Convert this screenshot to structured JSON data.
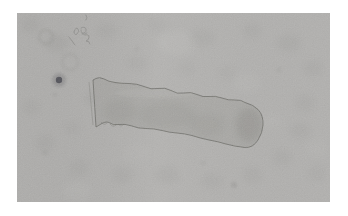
{
  "image": {
    "kind": "brightfield-micrograph",
    "description": "Light-microscope photograph of an elongated, segmented rectangular specimen with scalloped edges lying diagonally on a mottled light-gray background, framed by a white margin",
    "frame": {
      "width": 348,
      "height": 216,
      "margin_color": "#ffffff"
    },
    "photo": {
      "x": 17,
      "y": 13,
      "width": 313,
      "height": 189,
      "base_color": "#b4b3b1",
      "grain_opacity": 0.3,
      "vignette_left": "rgba(118,118,116,0.10)",
      "vignette_right": "rgba(128,128,126,0.05)"
    },
    "specimen": {
      "outline_color": "#6c6c66",
      "outline_width": 0.9,
      "outline_opacity": 0.85,
      "fill_color": "#a8a7a4",
      "fill_opacity": 0.75,
      "path": "M76,67 L79,114 C83,112 88,107 93,110 Q96,112.5 101,111.5 Q108,110.5 115,113 Q121,115.5 129,115.5 Q137,115.5 145,117.5 Q152,119.5 160,120 Q167,120.5 175,122.5 Q184,125.5 192,127 Q201,128.5 209,131 Q218,133.5 228,134.5 Q236,135 241,127 Q245.5,120 246,112 Q246.5,102 241,96.5 Q236,91.5 228,89.5 Q224,86.5 218,87 Q211,87.5 205,85 Q198,82.5 192,83.5 Q186,84.5 180,81.5 Q174,78.5 167,80 Q160,81.5 154,77.5 Q148,74 141,75.5 Q134,77 127,73.5 Q120,70.5 112,70.5 Q104,70.5 98,69.5 Q91,68.5 87,66 Q82,63.5 79,65.5 Z",
      "inner_shadow_color": "#84837f",
      "inner_shadows": [
        [
          232,
          112,
          13,
          17,
          0.3
        ],
        [
          150,
          102,
          28,
          13,
          0.14
        ],
        [
          103,
          98,
          16,
          11,
          0.14
        ],
        [
          190,
          112,
          18,
          11,
          0.12
        ]
      ],
      "inner_highlight": [
        140,
        80,
        42,
        5,
        0.16
      ],
      "double_edge": {
        "path": "M72,69 L76,112",
        "color": "#83837e",
        "opacity": 0.5
      },
      "scallop_ticks": {
        "color": "#76766f",
        "opacity": 0.45,
        "paths": [
          "M84,109 q3,4 6,1",
          "M93,111 q3,4 6,1",
          "M101,111 q3,4 6,0"
        ]
      }
    },
    "marks": {
      "squiggles": {
        "color": "#7d7d7a",
        "width": 0.9,
        "opacity": 0.55,
        "paths": [
          "M57,19 q2,-6 4,-3 q2,2 -1,5 q-2,2 -3,-2",
          "M64,15 q4,-2 5,1 q1,3 -2,4 q-3,1 -3,-3",
          "M65,21 q3,1 5,-1",
          "M68,22 q4,-1 4,2 q0,3 -3,4 q4,0 4,3",
          "M52,24 l6,8",
          "M69,2 q2,3 0,5"
        ]
      },
      "rings": {
        "color": "#8f8f8b",
        "items": [
          [
            29,
            24,
            7,
            0.3
          ],
          [
            53,
            49,
            8,
            0.22
          ]
        ]
      },
      "dark_blob": {
        "cx": 42,
        "cy": 67,
        "r": 3.2,
        "color": "#4f4f56",
        "halo_r": 7,
        "halo_opacity": 0.35,
        "halo_color": "#6e6e72"
      },
      "spots": {
        "color": "#80807c",
        "items": [
          [
            217,
            172,
            3,
            0.28
          ],
          [
            262,
            57,
            2.5,
            0.15
          ],
          [
            38,
            82,
            2,
            0.2
          ],
          [
            120,
            36,
            2.2,
            0.15
          ],
          [
            186,
            150,
            2.5,
            0.14
          ],
          [
            28,
            140,
            2.4,
            0.16
          ]
        ]
      }
    },
    "smudges": {
      "color": "#8e8e8b",
      "items": [
        [
          13,
          12,
          10,
          8,
          0.14
        ],
        [
          40,
          30,
          12,
          9,
          0.16
        ],
        [
          90,
          18,
          11,
          8,
          0.12
        ],
        [
          140,
          12,
          10,
          7,
          0.1
        ],
        [
          185,
          25,
          13,
          9,
          0.12
        ],
        [
          235,
          18,
          10,
          8,
          0.12
        ],
        [
          272,
          30,
          12,
          9,
          0.14
        ],
        [
          296,
          55,
          11,
          8,
          0.13
        ],
        [
          288,
          90,
          10,
          9,
          0.12
        ],
        [
          283,
          118,
          11,
          8,
          0.13
        ],
        [
          265,
          145,
          10,
          8,
          0.12
        ],
        [
          235,
          162,
          10,
          8,
          0.12
        ],
        [
          195,
          168,
          11,
          8,
          0.12
        ],
        [
          150,
          162,
          12,
          9,
          0.13
        ],
        [
          105,
          162,
          11,
          8,
          0.13
        ],
        [
          62,
          155,
          10,
          8,
          0.12
        ],
        [
          28,
          130,
          10,
          9,
          0.13
        ],
        [
          14,
          95,
          9,
          8,
          0.12
        ],
        [
          55,
          115,
          9,
          7,
          0.1
        ],
        [
          120,
          50,
          11,
          8,
          0.1
        ],
        [
          170,
          55,
          9,
          7,
          0.09
        ],
        [
          210,
          60,
          10,
          7,
          0.08
        ],
        [
          300,
          160,
          9,
          8,
          0.11
        ],
        [
          75,
          85,
          8,
          7,
          0.12
        ]
      ]
    },
    "highlights": {
      "color": "#c8c8c5",
      "items": [
        [
          160,
          30,
          20,
          12,
          0.2
        ],
        [
          230,
          70,
          14,
          10,
          0.15
        ],
        [
          60,
          178,
          14,
          9,
          0.18
        ],
        [
          255,
          108,
          10,
          8,
          0.12
        ],
        [
          300,
          135,
          10,
          8,
          0.12
        ],
        [
          120,
          140,
          14,
          9,
          0.1
        ]
      ]
    }
  }
}
